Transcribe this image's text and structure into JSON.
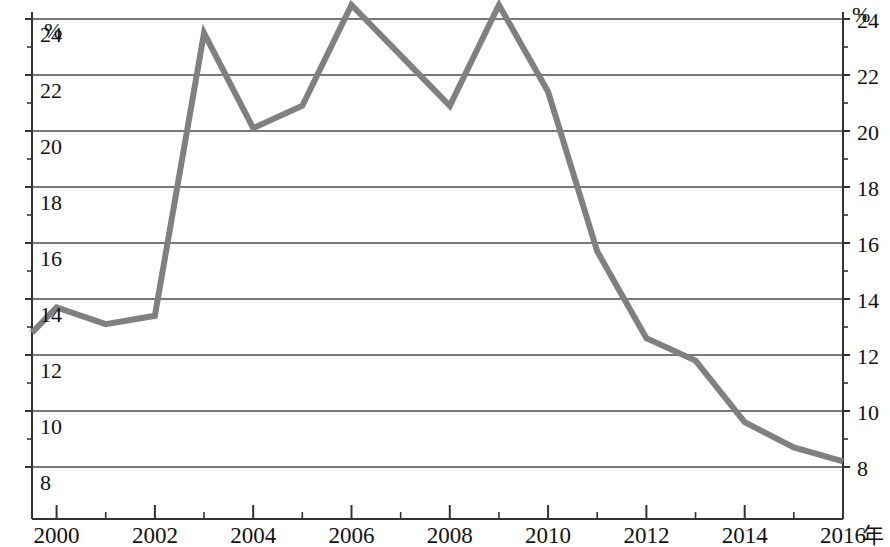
{
  "chart_data": {
    "type": "line",
    "title": "",
    "subtitle": "",
    "xlabel": "年",
    "ylabel": "%",
    "ylabel_right": "%",
    "x": [
      2000,
      2001,
      2002,
      2003,
      2004,
      2005,
      2006,
      2007,
      2008,
      2009,
      2010,
      2011,
      2012,
      2013,
      2014,
      2015,
      2016
    ],
    "x_start_value": 1999.5,
    "series": [
      {
        "name": "",
        "color": "#808080",
        "points": [
          {
            "x": 1999.5,
            "y": 12.8
          },
          {
            "x": 2000,
            "y": 13.7
          },
          {
            "x": 2001,
            "y": 13.1
          },
          {
            "x": 2002,
            "y": 13.4
          },
          {
            "x": 2003,
            "y": 23.5
          },
          {
            "x": 2004,
            "y": 20.1
          },
          {
            "x": 2005,
            "y": 20.9
          },
          {
            "x": 2006,
            "y": 24.5
          },
          {
            "x": 2007,
            "y": 22.7
          },
          {
            "x": 2008,
            "y": 20.9
          },
          {
            "x": 2009,
            "y": 24.5
          },
          {
            "x": 2010,
            "y": 21.4
          },
          {
            "x": 2011,
            "y": 15.7
          },
          {
            "x": 2012,
            "y": 12.6
          },
          {
            "x": 2013,
            "y": 11.8
          },
          {
            "x": 2014,
            "y": 9.6
          },
          {
            "x": 2015,
            "y": 8.7
          },
          {
            "x": 2016,
            "y": 8.2
          }
        ]
      }
    ],
    "xlim": [
      1999.5,
      2016
    ],
    "ylim": [
      7.5,
      24.7
    ],
    "ytick_values": [
      8,
      10,
      12,
      14,
      16,
      18,
      20,
      22,
      24
    ],
    "ytick_labels_left": [
      "8",
      "10",
      "12",
      "14",
      "16",
      "18",
      "20",
      "22",
      "24"
    ],
    "ytick_labels_right": [
      "8",
      "10",
      "12",
      "14",
      "16",
      "18",
      "20",
      "22",
      "24"
    ],
    "yminor_values": [
      9,
      11,
      13,
      15,
      17,
      19,
      21,
      23
    ],
    "xtick_values": [
      2000,
      2002,
      2004,
      2006,
      2008,
      2010,
      2012,
      2014,
      2016
    ],
    "xtick_labels": [
      "2000",
      "2002",
      "2004",
      "2006",
      "2008",
      "2010",
      "2012",
      "2014",
      "2016"
    ],
    "xminor_values": [
      2001,
      2003,
      2005,
      2007,
      2009,
      2011,
      2013,
      2015
    ],
    "grid": true,
    "grid_axis": "y",
    "grid_color": "#4d4d4d",
    "axis_color": "#333333",
    "legend": "none",
    "legend_position": "none"
  },
  "axes": {
    "unit_top_left": "%",
    "unit_top_right": "%",
    "x_axis_unit": "年"
  }
}
